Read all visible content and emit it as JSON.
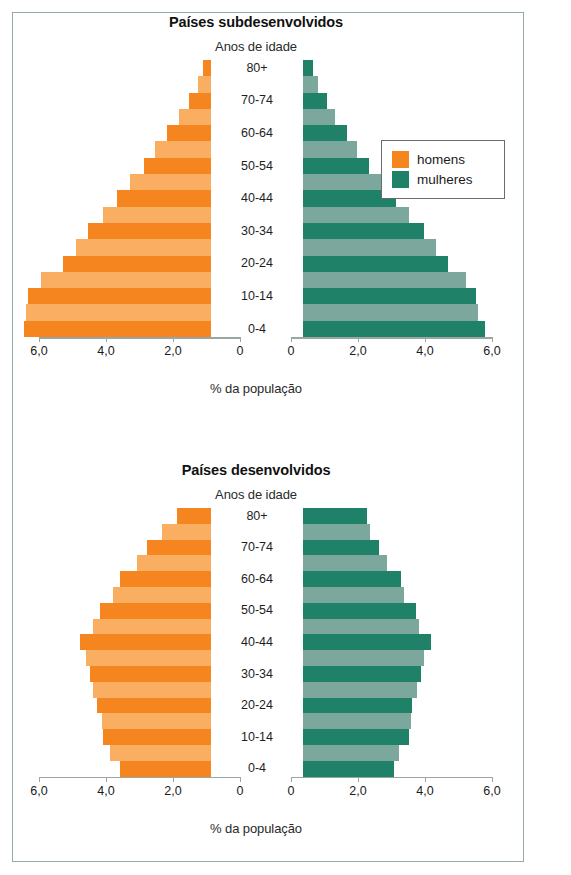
{
  "credit": "Ericson Guilherme Luciano/Arquivo da editora",
  "colors": {
    "men_dark": "#F5851F",
    "men_light": "#F9AE62",
    "women_dark": "#1F8168",
    "women_light": "#7CA79D",
    "frame": "#93aaa8",
    "axis": "#9aa6a4"
  },
  "legend": {
    "items": [
      {
        "label": "homens",
        "color": "#F5851F"
      },
      {
        "label": "mulheres",
        "color": "#1F8168"
      }
    ]
  },
  "axis": {
    "tick_labels_left": [
      "6,0",
      "4,0",
      "2,0",
      "0"
    ],
    "tick_labels_right": [
      "0",
      "2,0",
      "4,0",
      "6,0"
    ],
    "tick_values": [
      0,
      2,
      4,
      6
    ],
    "max": 6,
    "caption": "% da população",
    "age_axis_title": "Anos de idade"
  },
  "chart_data": [
    {
      "type": "bar",
      "orientation": "horizontal",
      "subtype": "population-pyramid",
      "title": "Países subdesenvolvidos",
      "xlabel": "% da população",
      "ylabel": "Anos de idade",
      "xlim": [
        0,
        6
      ],
      "grid": false,
      "legend_position": "top-right",
      "categories": [
        "0-4",
        "5-9",
        "10-14",
        "15-19",
        "20-24",
        "25-29",
        "30-34",
        "35-39",
        "40-44",
        "45-49",
        "50-54",
        "55-59",
        "60-64",
        "65-69",
        "70-74",
        "75-79",
        "80+"
      ],
      "visible_tick_labels": [
        "0-4",
        "10-14",
        "20-24",
        "30-34",
        "40-44",
        "50-54",
        "60-64",
        "70-74",
        "80+"
      ],
      "series": [
        {
          "name": "homens",
          "side": "left",
          "values": [
            5.55,
            5.5,
            5.45,
            5.05,
            4.4,
            4.0,
            3.65,
            3.2,
            2.8,
            2.4,
            2.0,
            1.65,
            1.3,
            0.95,
            0.65,
            0.4,
            0.25
          ]
        },
        {
          "name": "mulheres",
          "side": "right",
          "values": [
            5.4,
            5.2,
            5.15,
            4.85,
            4.3,
            3.95,
            3.6,
            3.15,
            2.75,
            2.35,
            1.95,
            1.6,
            1.3,
            0.95,
            0.7,
            0.45,
            0.3
          ]
        }
      ]
    },
    {
      "type": "bar",
      "orientation": "horizontal",
      "subtype": "population-pyramid",
      "title": "Países desenvolvidos",
      "xlabel": "% da população",
      "ylabel": "Anos de idade",
      "xlim": [
        0,
        6
      ],
      "grid": false,
      "legend_position": "none",
      "categories": [
        "0-4",
        "5-9",
        "10-14",
        "15-19",
        "20-24",
        "25-29",
        "30-34",
        "35-39",
        "40-44",
        "45-49",
        "50-54",
        "55-59",
        "60-64",
        "65-69",
        "70-74",
        "75-79",
        "80+"
      ],
      "visible_tick_labels": [
        "0-4",
        "10-14",
        "20-24",
        "30-34",
        "40-44",
        "50-54",
        "60-64",
        "70-74",
        "80+"
      ],
      "series": [
        {
          "name": "homens",
          "side": "left",
          "values": [
            2.7,
            3.0,
            3.2,
            3.25,
            3.4,
            3.5,
            3.6,
            3.7,
            3.9,
            3.5,
            3.3,
            2.9,
            2.7,
            2.2,
            1.9,
            1.45,
            1.0
          ]
        },
        {
          "name": "mulheres",
          "side": "right",
          "values": [
            2.7,
            2.85,
            3.15,
            3.2,
            3.25,
            3.4,
            3.5,
            3.6,
            3.8,
            3.45,
            3.35,
            3.0,
            2.9,
            2.5,
            2.25,
            2.0,
            1.9
          ]
        }
      ]
    }
  ]
}
